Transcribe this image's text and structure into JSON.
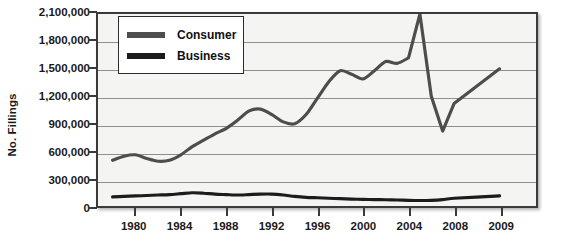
{
  "chart_data": {
    "type": "line",
    "title": "",
    "xlabel": "",
    "ylabel": "No. Fillings",
    "xlim": [
      1978,
      2009
    ],
    "ylim": [
      0,
      2100000
    ],
    "grid": true,
    "legend_position": "top-left",
    "y_ticks": [
      0,
      300000,
      600000,
      900000,
      1200000,
      1500000,
      1800000,
      2100000
    ],
    "y_tick_labels": [
      "0",
      "300,000",
      "600,000",
      "900,000",
      "1,200,000",
      "1,500,000",
      "1,800,000",
      "2,100,000"
    ],
    "x_ticks": [
      1980,
      1984,
      1988,
      1992,
      1996,
      2000,
      2004,
      2008,
      2009
    ],
    "x_tick_labels": [
      "1980",
      "1984",
      "1988",
      "1992",
      "1996",
      "2000",
      "2004",
      "2008",
      "2009"
    ],
    "series": [
      {
        "name": "Consumer",
        "color": "#4d4d4d",
        "x": [
          1978,
          1979,
          1980,
          1981,
          1982,
          1983,
          1984,
          1985,
          1986,
          1987,
          1988,
          1989,
          1990,
          1991,
          1992,
          1993,
          1994,
          1995,
          1996,
          1997,
          1998,
          1999,
          2000,
          2001,
          2002,
          2003,
          2004,
          2005,
          2006,
          2007,
          2008,
          2009
        ],
        "values": [
          500000,
          545000,
          560000,
          520000,
          490000,
          500000,
          560000,
          650000,
          720000,
          790000,
          850000,
          940000,
          1040000,
          1060000,
          1000000,
          920000,
          900000,
          1000000,
          1180000,
          1360000,
          1480000,
          1440000,
          1390000,
          1480000,
          1580000,
          1560000,
          1620000,
          2100000,
          1200000,
          820000,
          1120000,
          1500000
        ]
      },
      {
        "name": "Business",
        "color": "#1c1c1c",
        "x": [
          1978,
          1979,
          1980,
          1981,
          1982,
          1983,
          1984,
          1985,
          1986,
          1987,
          1988,
          1989,
          1990,
          1991,
          1992,
          1993,
          1994,
          1995,
          1996,
          1997,
          1998,
          1999,
          2000,
          2001,
          2002,
          2003,
          2004,
          2005,
          2006,
          2007,
          2008,
          2009
        ],
        "values": [
          100000,
          105000,
          110000,
          115000,
          120000,
          125000,
          135000,
          145000,
          140000,
          130000,
          125000,
          120000,
          125000,
          130000,
          130000,
          120000,
          105000,
          95000,
          90000,
          85000,
          80000,
          75000,
          72000,
          70000,
          68000,
          66000,
          62000,
          60000,
          62000,
          70000,
          85000,
          110000
        ]
      }
    ]
  },
  "legend": {
    "items": [
      {
        "label": "Consumer",
        "color": "#4d4d4d"
      },
      {
        "label": "Business",
        "color": "#1c1c1c"
      }
    ]
  },
  "axes": {
    "y_title": "No. Fillings"
  }
}
